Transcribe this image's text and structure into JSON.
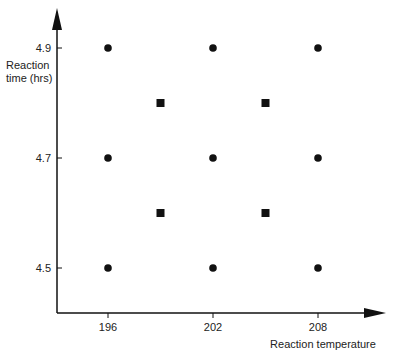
{
  "chart_data": {
    "type": "scatter",
    "title": "",
    "xlabel": "Reaction temperature",
    "ylabel": "Reaction time (hrs)",
    "ylabel_lines": [
      "Reaction",
      "time (hrs)"
    ],
    "xlim": [
      193.1,
      216.7
    ],
    "ylim": [
      4.413,
      4.982
    ],
    "x_ticks": [
      196,
      202,
      208
    ],
    "y_ticks": [
      4.5,
      4.7,
      4.9
    ],
    "x_tick_labels": [
      "196",
      "202",
      "208"
    ],
    "y_tick_labels": [
      "4.5",
      "4.7",
      "4.9"
    ],
    "grid": false,
    "legend": null,
    "series": [
      {
        "name": "factorial points",
        "marker": "circle",
        "color": "#111111",
        "points": [
          {
            "x": 196,
            "y": 4.9
          },
          {
            "x": 202,
            "y": 4.9
          },
          {
            "x": 208,
            "y": 4.9
          },
          {
            "x": 196,
            "y": 4.7
          },
          {
            "x": 202,
            "y": 4.7
          },
          {
            "x": 208,
            "y": 4.7
          },
          {
            "x": 196,
            "y": 4.5
          },
          {
            "x": 202,
            "y": 4.5
          },
          {
            "x": 208,
            "y": 4.5
          }
        ]
      },
      {
        "name": "intermediate points",
        "marker": "square",
        "color": "#111111",
        "points": [
          {
            "x": 199,
            "y": 4.8
          },
          {
            "x": 205,
            "y": 4.8
          },
          {
            "x": 199,
            "y": 4.6
          },
          {
            "x": 205,
            "y": 4.6
          }
        ]
      }
    ]
  }
}
